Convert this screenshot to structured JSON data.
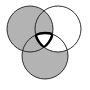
{
  "diagram": {
    "type": "venn-3-circle",
    "colors": {
      "background": "#ffffff",
      "shaded": "#b3b3b3",
      "unshaded": "#ffffff",
      "stroke": "#1a1a1a"
    },
    "circles": [
      {
        "id": "A",
        "position": "top-left",
        "cx": 30,
        "cy": 29,
        "r": 23
      },
      {
        "id": "B",
        "position": "top-right",
        "cx": 58,
        "cy": 29,
        "r": 23
      },
      {
        "id": "C",
        "position": "bottom",
        "cx": 45,
        "cy": 56,
        "r": 23
      }
    ],
    "shaded_regions": [
      "A only",
      "A∩B",
      "A∩C",
      "C only"
    ],
    "unshaded_regions": [
      "B only",
      "B∩C",
      "A∩B∩C"
    ],
    "highlighted_region": "A∩B∩C"
  }
}
